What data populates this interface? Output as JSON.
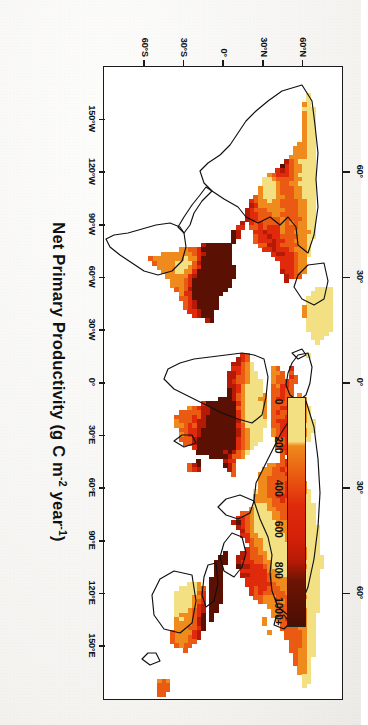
{
  "figure": {
    "axis_title_main": "Net Primary Productivity (g C m",
    "axis_title_sup1": "-2",
    "axis_title_mid": " year",
    "axis_title_sup2": "-1",
    "axis_title_end": ")",
    "axis_title_plain": "Net Primary Productivity (g C m-2 year-1)",
    "orientation": "rotated-90-ccw",
    "background_color": "#ffffff",
    "frame_color": "#1a1a1a"
  },
  "colorbar": {
    "name": "npp-colorbar",
    "tick_labels": [
      "0",
      "200",
      "400",
      "600",
      "800",
      "1000+"
    ],
    "tick_values": [
      0,
      200,
      400,
      600,
      800,
      1000
    ],
    "tick_positions_pct": [
      2,
      21,
      40,
      58,
      76,
      94
    ],
    "colors": [
      "#f3e083",
      "#ef8a1c",
      "#ea5a12",
      "#df2b0c",
      "#b41a06",
      "#5a1103"
    ],
    "units": "g C m-2 year-1",
    "min": 0,
    "max": 1000
  },
  "axes": {
    "longitude": {
      "label": "Longitude",
      "ticks": [
        "150°W",
        "120°W",
        "90°W",
        "60°W",
        "30°W",
        "0°",
        "30°E",
        "60°E",
        "90°E",
        "120°E",
        "150°E"
      ],
      "values": [
        -150,
        -120,
        -90,
        -60,
        -30,
        0,
        30,
        60,
        90,
        120,
        150
      ],
      "range": [
        -180,
        180
      ]
    },
    "latitude_left": {
      "label": "Latitude",
      "ticks": [
        "60°N",
        "30°N",
        "0°",
        "30°S",
        "60°S"
      ],
      "values": [
        60,
        30,
        0,
        -30,
        -60
      ],
      "range": [
        -90,
        90
      ]
    },
    "latitude_top": {
      "label": "Latitude",
      "ticks": [
        "60°",
        "30°",
        "0°",
        "30°",
        "60°"
      ],
      "values": [
        60,
        30,
        0,
        -30,
        -60
      ]
    }
  },
  "chart_data": {
    "type": "heatmap",
    "title": "Net Primary Productivity (g C m-2 year-1)",
    "xlabel": "Longitude",
    "ylabel": "Latitude",
    "xlim": [
      -180,
      180
    ],
    "ylim": [
      -90,
      90
    ],
    "grid": false,
    "legend": "colorbar, horizontal, inside plot right-centre",
    "colorscale": {
      "stops": [
        {
          "value": 0,
          "color": "#f3e083"
        },
        {
          "value": 200,
          "color": "#ef8a1c"
        },
        {
          "value": 400,
          "color": "#ea5a12"
        },
        {
          "value": 600,
          "color": "#df2b0c"
        },
        {
          "value": 800,
          "color": "#b41a06"
        },
        {
          "value": 1000,
          "color": "#5a1103"
        }
      ],
      "tick_labels": [
        "0",
        "200",
        "400",
        "600",
        "800",
        "1000+"
      ]
    },
    "regions": [
      {
        "name": "Amazon Basin",
        "value": 1000,
        "color": "#5a1103"
      },
      {
        "name": "Congo Basin",
        "value": 1000,
        "color": "#5a1103"
      },
      {
        "name": "Southeast Asia / Indonesia",
        "value": 1000,
        "color": "#5a1103"
      },
      {
        "name": "Boreal North America",
        "value": 400,
        "color": "#ea5a12"
      },
      {
        "name": "Boreal Eurasia",
        "value": 400,
        "color": "#ea5a12"
      },
      {
        "name": "Sahara Desert",
        "value": 100,
        "color": "#f3e083"
      },
      {
        "name": "Arabian Peninsula",
        "value": 100,
        "color": "#f3e083"
      },
      {
        "name": "Central Australia",
        "value": 100,
        "color": "#f3e083"
      },
      {
        "name": "Greenland interior",
        "value": 100,
        "color": "#f3e083"
      },
      {
        "name": "Central Asia steppe",
        "value": 100,
        "color": "#f3e083"
      },
      {
        "name": "Eastern North America",
        "value": 800,
        "color": "#b41a06"
      },
      {
        "name": "Western Europe",
        "value": 800,
        "color": "#b41a06"
      },
      {
        "name": "Southeastern Brazil",
        "value": 600,
        "color": "#df2b0c"
      },
      {
        "name": "India",
        "value": 600,
        "color": "#df2b0c"
      },
      {
        "name": "Eastern China",
        "value": 800,
        "color": "#b41a06"
      }
    ]
  }
}
